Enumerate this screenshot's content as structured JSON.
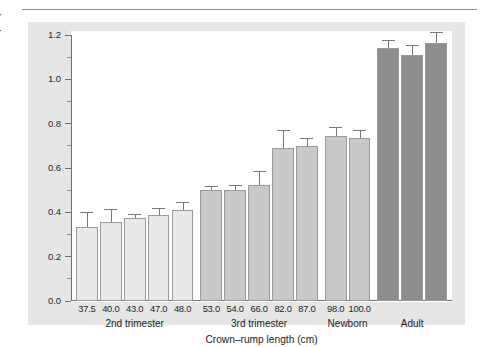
{
  "figure": {
    "background": "#e6e6e6",
    "plot_background": "#ffffff",
    "axis_color": "#6f6f6f"
  },
  "chart_data": {
    "type": "bar",
    "title": "",
    "xlabel": "Crown–rump length (cm)",
    "ylabel": "Bladder thickness (cm)",
    "ylim": [
      0.0,
      1.2
    ],
    "ytick_labels": [
      "0.0",
      "0.2",
      "0.4",
      "0.6",
      "0.8",
      "1.0",
      "1.2"
    ],
    "ytick_values": [
      0.0,
      0.2,
      0.4,
      0.6,
      0.8,
      1.0,
      1.2
    ],
    "yminor_step": 0.1,
    "grid": false,
    "legend": "none",
    "error_bars": "upper-only",
    "categories": [
      "37.5",
      "40.0",
      "43.0",
      "47.0",
      "48.0",
      "53.0",
      "54.0",
      "66.0",
      "82.0",
      "87.0",
      "98.0",
      "100.0",
      "",
      "",
      ""
    ],
    "values": [
      0.335,
      0.355,
      0.375,
      0.39,
      0.41,
      0.5,
      0.5,
      0.525,
      0.69,
      0.7,
      0.745,
      0.735,
      1.14,
      1.11,
      1.165
    ],
    "error_upper": [
      0.06,
      0.055,
      0.012,
      0.025,
      0.03,
      0.015,
      0.02,
      0.055,
      0.075,
      0.03,
      0.035,
      0.03,
      0.035,
      0.04,
      0.045
    ],
    "bar_colors": [
      "#e9e9e9",
      "#e9e9e9",
      "#e9e9e9",
      "#e9e9e9",
      "#e9e9e9",
      "#c9c9c9",
      "#c9c9c9",
      "#c9c9c9",
      "#c9c9c9",
      "#c9c9c9",
      "#c9c9c9",
      "#c9c9c9",
      "#8d8d8d",
      "#8d8d8d",
      "#8d8d8d"
    ],
    "groups": [
      {
        "label": "2nd trimester",
        "start": 0,
        "end": 4
      },
      {
        "label": "3rd trimester",
        "start": 5,
        "end": 9
      },
      {
        "label": "Newborn",
        "start": 10,
        "end": 11
      },
      {
        "label": "Adult",
        "start": 12,
        "end": 14
      }
    ]
  }
}
